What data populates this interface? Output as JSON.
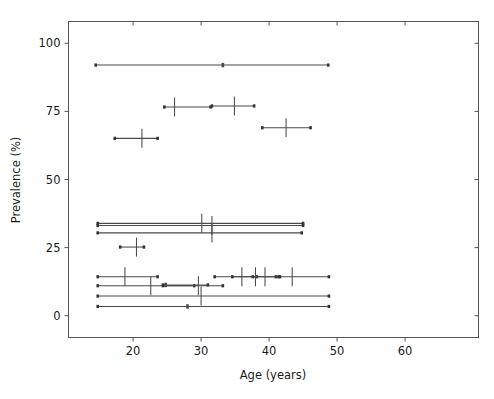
{
  "chart_data": {
    "type": "scatter",
    "title": "",
    "xlabel": "Age (years)",
    "ylabel": "Prevalence (%)",
    "xlim": [
      10.5,
      70.8
    ],
    "ylim": [
      -8,
      108
    ],
    "xticks": [
      20,
      30,
      40,
      50,
      60
    ],
    "yticks": [
      0,
      25,
      50,
      75,
      100
    ],
    "xtick_labels": [
      "20",
      "30",
      "40",
      "50",
      "60"
    ],
    "ytick_labels": [
      "0",
      "25",
      "50",
      "75",
      "100"
    ],
    "grid": false,
    "legend": null,
    "marker_style": "plus-with-horizontal-error-bars",
    "points": [
      {
        "id": "s01",
        "age": 33.2,
        "age_low": 14.5,
        "age_high": 48.7,
        "prevalence": 92.0,
        "vertical_tick": false
      },
      {
        "id": "s02",
        "age": 26.1,
        "age_low": 24.6,
        "age_high": 31.4,
        "prevalence": 76.6,
        "vertical_tick": true
      },
      {
        "id": "s03",
        "age": 34.9,
        "age_low": 31.6,
        "age_high": 37.8,
        "prevalence": 77.0,
        "vertical_tick": true
      },
      {
        "id": "s04",
        "age": 42.5,
        "age_low": 39.0,
        "age_high": 46.1,
        "prevalence": 69.0,
        "vertical_tick": true
      },
      {
        "id": "s05",
        "age": 21.3,
        "age_low": 17.3,
        "age_high": 23.6,
        "prevalence": 65.1,
        "vertical_tick": true
      },
      {
        "id": "s06",
        "age": 30.1,
        "age_low": 14.8,
        "age_high": 45.0,
        "prevalence": 33.9,
        "vertical_tick": true
      },
      {
        "id": "s07",
        "age": 31.6,
        "age_low": 14.8,
        "age_high": 45.0,
        "prevalence": 33.1,
        "vertical_tick": true
      },
      {
        "id": "s08",
        "age": 31.6,
        "age_low": 14.8,
        "age_high": 44.8,
        "prevalence": 30.4,
        "vertical_tick": true
      },
      {
        "id": "s09",
        "age": 20.5,
        "age_low": 18.1,
        "age_high": 21.6,
        "prevalence": 25.2,
        "vertical_tick": true
      },
      {
        "id": "s10",
        "age": 18.8,
        "age_low": 14.8,
        "age_high": 23.6,
        "prevalence": 14.3,
        "vertical_tick": true
      },
      {
        "id": "s11",
        "age": 36.0,
        "age_low": 32.0,
        "age_high": 38.2,
        "prevalence": 14.3,
        "vertical_tick": true
      },
      {
        "id": "s12",
        "age": 38.0,
        "age_low": 34.6,
        "age_high": 41.0,
        "prevalence": 14.3,
        "vertical_tick": true
      },
      {
        "id": "s13",
        "age": 39.4,
        "age_low": 37.6,
        "age_high": 41.4,
        "prevalence": 14.3,
        "vertical_tick": true
      },
      {
        "id": "s14",
        "age": 43.4,
        "age_low": 41.6,
        "age_high": 48.8,
        "prevalence": 14.3,
        "vertical_tick": true
      },
      {
        "id": "s15",
        "age": 22.6,
        "age_low": 14.8,
        "age_high": 29.0,
        "prevalence": 11.0,
        "vertical_tick": true
      },
      {
        "id": "s16",
        "age": 29.6,
        "age_low": 24.4,
        "age_high": 33.2,
        "prevalence": 11.0,
        "vertical_tick": true
      },
      {
        "id": "s17",
        "age": 24.8,
        "age_low": 24.4,
        "age_high": 31.0,
        "prevalence": 11.3,
        "vertical_tick": false
      },
      {
        "id": "s18",
        "age": 30.0,
        "age_low": 14.8,
        "age_high": 48.8,
        "prevalence": 7.2,
        "vertical_tick": true
      },
      {
        "id": "s19",
        "age": 28.0,
        "age_low": 14.8,
        "age_high": 48.8,
        "prevalence": 3.4,
        "vertical_tick": false
      }
    ]
  },
  "axis": {
    "xlabel": "Age (years)",
    "ylabel": "Prevalence (%)"
  },
  "colors": {
    "background": "#ffffff",
    "spine": "#555555",
    "data": "#4a4a4a",
    "text": "#1a1a1a"
  }
}
